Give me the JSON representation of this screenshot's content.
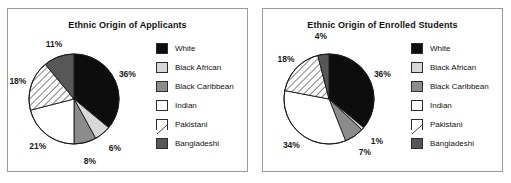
{
  "palette": {
    "white_slice": "#0d0d0d",
    "black_african": "#d8d8d8",
    "black_caribbean": "#8c8c8c",
    "indian": "#ffffff",
    "pakistani": "#ffffff",
    "bangladeshi": "#575757",
    "outline": "#1a1a1a",
    "panel_border": "#9a9a9a",
    "text": "#111111",
    "background": "#ffffff"
  },
  "legend": {
    "entries": [
      {
        "label": "White",
        "swatch": "black-swatch",
        "fill": "#0d0d0d",
        "pattern": "solid"
      },
      {
        "label": "Black African",
        "swatch": "light-gray-swatch",
        "fill": "#d8d8d8",
        "pattern": "solid"
      },
      {
        "label": "Black Caribbean",
        "swatch": "medium-gray-swatch",
        "fill": "#8c8c8c",
        "pattern": "solid"
      },
      {
        "label": "Indian",
        "swatch": "white-swatch",
        "fill": "#ffffff",
        "pattern": "solid"
      },
      {
        "label": "Pakistani",
        "swatch": "diagonal-hatch-swatch",
        "fill": "#ffffff",
        "pattern": "hatch"
      },
      {
        "label": "Bangladeshi",
        "swatch": "dark-gray-swatch",
        "fill": "#575757",
        "pattern": "solid"
      }
    ]
  },
  "chart_data": [
    {
      "type": "pie",
      "title": "Ethnic Origin of Applicants",
      "xlabel": "",
      "ylabel": "",
      "legend_position": "right",
      "grid": false,
      "categories": [
        "White",
        "Black African",
        "Black Caribbean",
        "Indian",
        "Pakistani",
        "Bangladeshi"
      ],
      "values": [
        36,
        6,
        8,
        21,
        18,
        11
      ],
      "data_labels": [
        "36%",
        "6%",
        "8%",
        "21%",
        "18%",
        "11%"
      ]
    },
    {
      "type": "pie",
      "title": "Ethnic Origin of Enrolled Students",
      "xlabel": "",
      "ylabel": "",
      "legend_position": "right",
      "grid": false,
      "categories": [
        "White",
        "Black African",
        "Black Caribbean",
        "Indian",
        "Pakistani",
        "Bangladeshi"
      ],
      "values": [
        36,
        1,
        7,
        34,
        18,
        4
      ],
      "data_labels": [
        "36%",
        "1%",
        "7%",
        "34%",
        "18%",
        "4%"
      ]
    }
  ]
}
